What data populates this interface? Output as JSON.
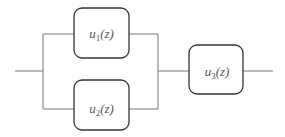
{
  "diagram": {
    "type": "block-diagram",
    "blocks": [
      {
        "id": "u1",
        "base": "u",
        "sub": "1",
        "arg": "(z)",
        "label": "u1(z)"
      },
      {
        "id": "u2",
        "base": "u",
        "sub": "2",
        "arg": "(z)",
        "label": "u2(z)"
      },
      {
        "id": "u3",
        "base": "u",
        "sub": "3",
        "arg": "(z)",
        "label": "u3(z)"
      }
    ],
    "connections": [
      {
        "from": "input",
        "to": "split"
      },
      {
        "from": "split",
        "to": "u1"
      },
      {
        "from": "split",
        "to": "u2"
      },
      {
        "from": "u1",
        "to": "merge"
      },
      {
        "from": "u2",
        "to": "merge"
      },
      {
        "from": "merge",
        "to": "u3"
      },
      {
        "from": "u3",
        "to": "output"
      }
    ],
    "colors": {
      "line": "#8a8a8a",
      "block_border": "#333333",
      "text": "#555555"
    }
  }
}
